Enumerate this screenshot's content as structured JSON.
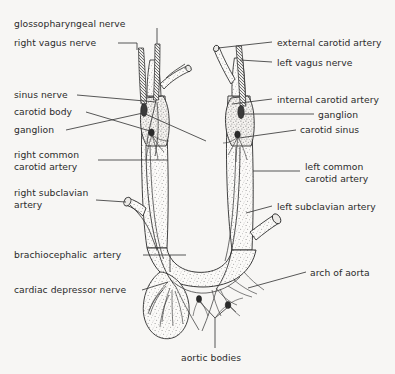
{
  "figure": {
    "background_color": "#f7f6f4",
    "line_color": "#2b2b2b",
    "stipple_color": "#6f6f6f",
    "labels_left": [
      {
        "id": "glossopharyngeal-nerve",
        "text": "glossopharyngeal nerve",
        "x": 14,
        "y": 18,
        "leader": false
      },
      {
        "id": "right-vagus-nerve",
        "text": "right vagus nerve",
        "x": 14,
        "y": 38,
        "leader": true
      },
      {
        "id": "sinus-nerve",
        "text": "sinus nerve",
        "x": 14,
        "y": 90,
        "leader": true
      },
      {
        "id": "carotid-body",
        "text": "carotid body",
        "x": 14,
        "y": 107,
        "leader": true
      },
      {
        "id": "ganglion-left-label",
        "text": "ganglion",
        "x": 14,
        "y": 125,
        "leader": true
      },
      {
        "id": "right-common-carotid-artery",
        "text": "right common\ncarotid artery",
        "x": 14,
        "y": 150,
        "leader": true
      },
      {
        "id": "right-subclavian-artery",
        "text": "right subclavian\nartery",
        "x": 14,
        "y": 188,
        "leader": true
      },
      {
        "id": "brachiocephalic-artery",
        "text": "brachiocephalic  artery",
        "x": 14,
        "y": 250,
        "leader": true
      },
      {
        "id": "cardiac-depressor-nerve",
        "text": "cardiac depressor nerve",
        "x": 14,
        "y": 285,
        "leader": true
      }
    ],
    "labels_right": [
      {
        "id": "external-carotid-artery",
        "text": "external carotid artery",
        "x": 277,
        "y": 38,
        "leader": true
      },
      {
        "id": "left-vagus-nerve",
        "text": "left vagus nerve",
        "x": 277,
        "y": 59,
        "leader": true
      },
      {
        "id": "internal-carotid-artery",
        "text": "internal carotid artery",
        "x": 277,
        "y": 95,
        "leader": true
      },
      {
        "id": "ganglion-right-label",
        "text": "ganglion",
        "x": 318,
        "y": 110,
        "leader": true
      },
      {
        "id": "carotid-sinus",
        "text": "carotid sinus",
        "x": 300,
        "y": 125,
        "leader": true
      },
      {
        "id": "left-common-carotid-artery",
        "text": "left common\ncarotid artery",
        "x": 305,
        "y": 162,
        "leader": true
      },
      {
        "id": "left-subclavian-artery",
        "text": "left subclavian artery",
        "x": 277,
        "y": 202,
        "leader": true
      },
      {
        "id": "arch-of-aorta",
        "text": "arch of aorta",
        "x": 310,
        "y": 268,
        "leader": true
      }
    ],
    "labels_bottom": [
      {
        "id": "aortic-bodies",
        "text": "aortic bodies",
        "x": 181,
        "y": 353,
        "leader": true
      }
    ]
  }
}
